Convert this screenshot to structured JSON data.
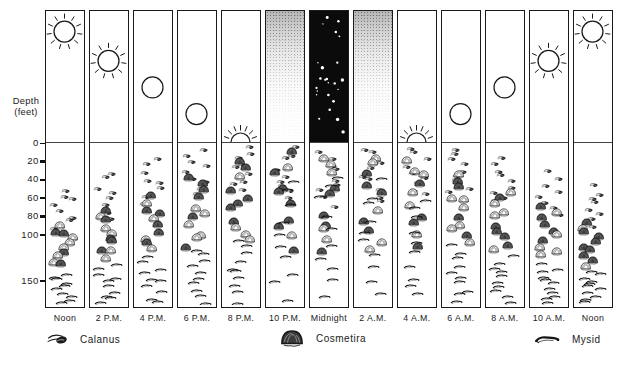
{
  "axis": {
    "title_line1": "Depth",
    "title_line2": "(feet)",
    "tick_values": [
      0,
      20,
      40,
      60,
      80,
      100,
      150
    ]
  },
  "legend": {
    "items": [
      {
        "id": "calanus",
        "label": "Calanus"
      },
      {
        "id": "cosmetira",
        "label": "Cosmetira"
      },
      {
        "id": "mysid",
        "label": "Mysid"
      }
    ]
  },
  "colors": {
    "ink": "#1a1a1a",
    "paper": "#ffffff",
    "night_sky": "#0b0b0b"
  },
  "columns": [
    {
      "time": "Noon",
      "sky": {
        "type": "sun",
        "elevation": 0.83
      },
      "organisms": {
        "calanus": {
          "min_ft": 48,
          "max_ft": 95,
          "count": 8
        },
        "cosmetira": {
          "min_ft": 88,
          "max_ft": 135,
          "count": 10
        },
        "mysid": {
          "min_ft": 140,
          "max_ft": 176,
          "count": 10
        }
      }
    },
    {
      "time": "2 P.M.",
      "sky": {
        "type": "sun",
        "elevation": 0.61
      },
      "organisms": {
        "calanus": {
          "min_ft": 30,
          "max_ft": 85,
          "count": 8
        },
        "cosmetira": {
          "min_ft": 72,
          "max_ft": 128,
          "count": 10
        },
        "mysid": {
          "min_ft": 132,
          "max_ft": 176,
          "count": 10
        }
      }
    },
    {
      "time": "4 P.M.",
      "sky": {
        "type": "disc",
        "elevation": 0.41
      },
      "organisms": {
        "calanus": {
          "min_ft": 14,
          "max_ft": 70,
          "count": 8
        },
        "cosmetira": {
          "min_ft": 55,
          "max_ft": 120,
          "count": 10
        },
        "mysid": {
          "min_ft": 122,
          "max_ft": 176,
          "count": 10
        }
      }
    },
    {
      "time": "6 P.M.",
      "sky": {
        "type": "disc",
        "elevation": 0.21
      },
      "organisms": {
        "calanus": {
          "min_ft": 6,
          "max_ft": 60,
          "count": 9
        },
        "cosmetira": {
          "min_ft": 35,
          "max_ft": 115,
          "count": 11
        },
        "mysid": {
          "min_ft": 112,
          "max_ft": 176,
          "count": 10
        }
      }
    },
    {
      "time": "8 P.M.",
      "sky": {
        "type": "horizon-sun",
        "elevation": 0
      },
      "organisms": {
        "calanus": {
          "min_ft": 3,
          "max_ft": 55,
          "count": 9
        },
        "cosmetira": {
          "min_ft": 18,
          "max_ft": 112,
          "count": 11
        },
        "mysid": {
          "min_ft": 100,
          "max_ft": 176,
          "count": 10
        }
      }
    },
    {
      "time": "10 P.M.",
      "sky": {
        "type": "twilight"
      },
      "organisms": {
        "calanus": {
          "min_ft": 2,
          "max_ft": 65,
          "count": 9
        },
        "cosmetira": {
          "min_ft": 8,
          "max_ft": 118,
          "count": 10
        },
        "mysid": {
          "min_ft": 35,
          "max_ft": 172,
          "count": 10
        }
      }
    },
    {
      "time": "Midnight",
      "sky": {
        "type": "stars",
        "star_count": 24
      },
      "organisms": {
        "calanus": {
          "min_ft": 2,
          "max_ft": 75,
          "count": 9
        },
        "cosmetira": {
          "min_ft": 6,
          "max_ft": 128,
          "count": 10
        },
        "mysid": {
          "min_ft": 25,
          "max_ft": 172,
          "count": 10
        }
      }
    },
    {
      "time": "2 A.M.",
      "sky": {
        "type": "twilight"
      },
      "organisms": {
        "calanus": {
          "min_ft": 2,
          "max_ft": 68,
          "count": 9
        },
        "cosmetira": {
          "min_ft": 8,
          "max_ft": 122,
          "count": 10
        },
        "mysid": {
          "min_ft": 35,
          "max_ft": 172,
          "count": 10
        }
      }
    },
    {
      "time": "4 A.M.",
      "sky": {
        "type": "horizon-sun",
        "elevation": 0
      },
      "organisms": {
        "calanus": {
          "min_ft": 2,
          "max_ft": 60,
          "count": 9
        },
        "cosmetira": {
          "min_ft": 12,
          "max_ft": 115,
          "count": 10
        },
        "mysid": {
          "min_ft": 55,
          "max_ft": 174,
          "count": 10
        }
      }
    },
    {
      "time": "6 A.M.",
      "sky": {
        "type": "disc",
        "elevation": 0.21
      },
      "organisms": {
        "calanus": {
          "min_ft": 4,
          "max_ft": 58,
          "count": 9
        },
        "cosmetira": {
          "min_ft": 30,
          "max_ft": 115,
          "count": 11
        },
        "mysid": {
          "min_ft": 108,
          "max_ft": 176,
          "count": 10
        }
      }
    },
    {
      "time": "8 A.M.",
      "sky": {
        "type": "disc",
        "elevation": 0.41
      },
      "organisms": {
        "calanus": {
          "min_ft": 14,
          "max_ft": 68,
          "count": 9
        },
        "cosmetira": {
          "min_ft": 50,
          "max_ft": 120,
          "count": 10
        },
        "mysid": {
          "min_ft": 120,
          "max_ft": 176,
          "count": 10
        }
      }
    },
    {
      "time": "10 A.M.",
      "sky": {
        "type": "sun",
        "elevation": 0.61
      },
      "organisms": {
        "calanus": {
          "min_ft": 28,
          "max_ft": 82,
          "count": 8
        },
        "cosmetira": {
          "min_ft": 68,
          "max_ft": 126,
          "count": 10
        },
        "mysid": {
          "min_ft": 130,
          "max_ft": 176,
          "count": 11
        }
      }
    },
    {
      "time": "Noon",
      "sky": {
        "type": "sun",
        "elevation": 0.83
      },
      "organisms": {
        "calanus": {
          "min_ft": 45,
          "max_ft": 95,
          "count": 8
        },
        "cosmetira": {
          "min_ft": 85,
          "max_ft": 135,
          "count": 10
        },
        "mysid": {
          "min_ft": 138,
          "max_ft": 176,
          "count": 11
        }
      }
    }
  ]
}
